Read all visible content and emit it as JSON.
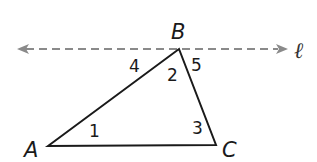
{
  "diagram": {
    "type": "triangle-with-parallel-line",
    "colors": {
      "triangle_stroke": "#1a1a1a",
      "line_stroke": "#8a8a8a",
      "background": "#ffffff"
    },
    "vertices": {
      "A": {
        "label": "A",
        "x": 48,
        "y": 146
      },
      "B": {
        "label": "B",
        "x": 179,
        "y": 49
      },
      "C": {
        "label": "C",
        "x": 216,
        "y": 145
      }
    },
    "line": {
      "label": "ℓ",
      "style": "dashed",
      "through": "B",
      "arrows": "both"
    },
    "angles": [
      {
        "label": "1",
        "at": "A"
      },
      {
        "label": "2",
        "at": "B",
        "position": "interior"
      },
      {
        "label": "3",
        "at": "C"
      },
      {
        "label": "4",
        "at": "B",
        "position": "between line and AB"
      },
      {
        "label": "5",
        "at": "B",
        "position": "between line and BC"
      }
    ]
  }
}
